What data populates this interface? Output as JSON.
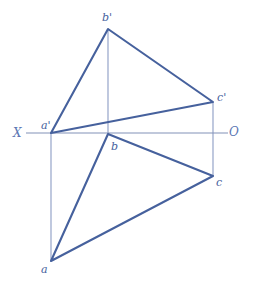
{
  "figure": {
    "type": "descriptive-geometry-projection",
    "canvas": {
      "width": 253,
      "height": 295,
      "background": "#ffffff"
    },
    "colors": {
      "stroke_heavy": "#46619d",
      "stroke_light": "#8b9cc4",
      "axis": "#8292b8",
      "label": "#46619d",
      "axis_label": "#5a76b3"
    },
    "axis": {
      "name": "ground-line",
      "left_label": "X",
      "right_label": "O",
      "y": 133,
      "x_start": 26,
      "x_end": 228,
      "left_label_pos": {
        "x": 13,
        "y": 127
      },
      "right_label_pos": {
        "x": 229,
        "y": 126
      }
    },
    "points": [
      {
        "id": "a-prime",
        "label": "a'",
        "x": 51,
        "y": 133,
        "view": "frontal",
        "label_pos": {
          "x": 41,
          "y": 120
        }
      },
      {
        "id": "b-prime",
        "label": "b'",
        "x": 108,
        "y": 29,
        "view": "frontal",
        "label_pos": {
          "x": 102,
          "y": 12
        }
      },
      {
        "id": "c-prime",
        "label": "c'",
        "x": 213,
        "y": 102,
        "view": "frontal",
        "label_pos": {
          "x": 217,
          "y": 92
        }
      },
      {
        "id": "a",
        "label": "a",
        "x": 51,
        "y": 261,
        "view": "horizontal",
        "label_pos": {
          "x": 41,
          "y": 264
        }
      },
      {
        "id": "b",
        "label": "b",
        "x": 108,
        "y": 134,
        "view": "horizontal",
        "label_pos": {
          "x": 111,
          "y": 141
        }
      },
      {
        "id": "c",
        "label": "c",
        "x": 213,
        "y": 176,
        "view": "horizontal",
        "label_pos": {
          "x": 216,
          "y": 177
        }
      }
    ],
    "triangles": [
      {
        "id": "frontal-projection",
        "name": "triangle-a-prime-b-prime-c-prime",
        "vertices": "51,133 108,29 213,102"
      },
      {
        "id": "horizontal-projection",
        "name": "triangle-a-b-c",
        "vertices": "51,261 108,134 213,176"
      }
    ],
    "connector_lines": [
      {
        "id": "connector-a",
        "x": 51,
        "y1": 133,
        "y2": 261
      },
      {
        "id": "connector-b",
        "x": 108,
        "y1": 29,
        "y2": 134
      },
      {
        "id": "connector-c",
        "x": 213,
        "y1": 102,
        "y2": 176
      }
    ]
  }
}
